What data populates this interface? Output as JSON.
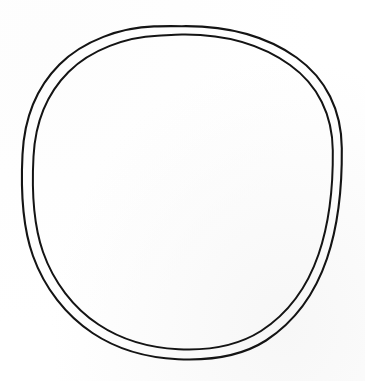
{
  "document": {
    "kind": "line-drawing",
    "medium": "hand-drawn ink on white paper",
    "subject": "two concentric hand-drawn circles forming a ring / annulus outline",
    "canvas_width": 365,
    "canvas_height": 381,
    "background_color": "#ffffff",
    "paper_tint_color": "#f7f7f7",
    "ink_color": "#141414"
  },
  "shapes": {
    "outer_circle": {
      "name": "outer-circle",
      "center_x": 182,
      "center_y": 192,
      "radius_x": 160,
      "radius_y": 166,
      "stroke_color": "#141414",
      "stroke_width": 2.1,
      "top_y": 26,
      "bottom_y": 359,
      "left_x": 22,
      "right_x": 342,
      "path": "M 182.0 26.2 C 226.0 25.6 266.0 36.0 296.5 57.5 C 326.0 78.5 341.5 110.5 341.8 148.0 C 342.2 186.0 338.5 224.5 327.0 258.5 C 315.5 292.5 295.0 321.5 266.0 340.5 C 238.5 358.0 206.0 360.5 178.0 359.2 C 148.0 357.8 118.0 350.0 92.5 333.0 C 66.0 315.5 44.5 288.0 33.0 256.0 C 21.5 224.0 20.8 188.0 22.5 154.5 C 24.2 120.0 35.5 88.5 59.5 64.5 C 83.5 40.5 121.0 27.5 154.0 26.4 C 163.5 26.0 172.8 26.1 182.0 26.2 Z"
    },
    "inner_circle": {
      "name": "inner-circle",
      "center_x": 182,
      "center_y": 193,
      "radius_x": 151,
      "radius_y": 157,
      "stroke_color": "#141414",
      "stroke_width": 2.0,
      "top_y": 34,
      "bottom_y": 350,
      "left_x": 31,
      "right_x": 333,
      "path": "M 182.0 34.5 C 224.0 34.0 261.5 44.5 290.0 65.0 C 318.0 85.0 332.5 115.0 332.8 150.5 C 333.2 186.5 329.5 222.5 318.5 254.5 C 307.5 286.5 288.0 313.5 261.0 331.0 C 235.0 347.5 204.5 350.5 178.5 349.2 C 150.5 347.8 122.5 340.5 98.5 324.5 C 73.5 308.0 53.5 282.0 43.0 252.0 C 32.5 222.0 31.8 188.0 33.5 156.5 C 35.2 124.0 46.0 94.5 68.5 72.0 C 91.0 49.5 126.5 37.0 157.5 35.8 C 165.5 35.4 173.8 34.6 182.0 34.5 Z"
    }
  },
  "annulus": {
    "name": "ring-gap",
    "gap_top_px": 7,
    "gap_right_px": 8,
    "gap_bottom_px": 10,
    "gap_left_px": 9,
    "fill_color": "#ffffff"
  }
}
